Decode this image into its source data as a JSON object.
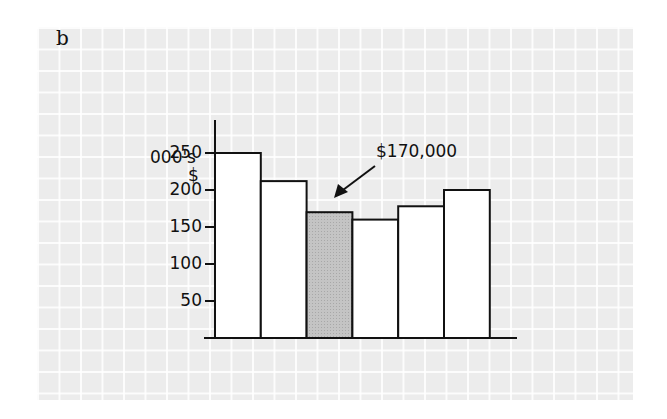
{
  "figure": {
    "label": "b"
  },
  "axis": {
    "unit_line1": "000's",
    "unit_line2": "$"
  },
  "annotation": {
    "text": "$170,000",
    "target_bar_index": 2
  },
  "colors": {
    "bar_fill": "#ffffff",
    "highlight_fill": "#c4c4c4",
    "stroke": "#111111",
    "background": "#ececec"
  },
  "chart_data": {
    "type": "bar",
    "title": "",
    "xlabel": "",
    "ylabel": "$ (000's)",
    "categories": [
      "1",
      "2",
      "3",
      "4",
      "5",
      "6"
    ],
    "values": [
      250,
      212,
      170,
      160,
      178,
      200
    ],
    "highlighted_index": 2,
    "annotation": "$170,000",
    "yticks": [
      50,
      100,
      150,
      200,
      250
    ],
    "ylim": [
      0,
      270
    ],
    "grid": false,
    "legend": null
  }
}
